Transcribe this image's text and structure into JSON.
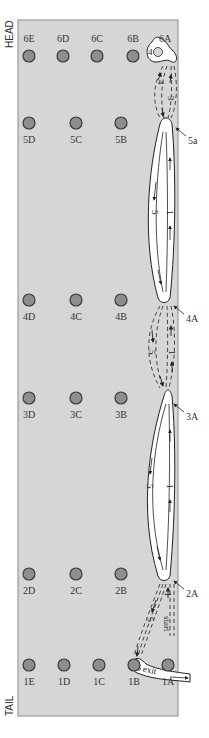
{
  "diagram": {
    "title": "",
    "side_labels": {
      "head": "HEAD",
      "tail": "TAIL"
    },
    "colors": {
      "panel_fill": "#d6d6d6",
      "panel_stroke": "#8a8a8a",
      "peg_fill": "#8e8e8e",
      "peg_stroke": "#3a3a3a",
      "loop_fill": "#ffffff",
      "loop_stroke": "#222222",
      "dash": "#333333"
    },
    "pegs": [
      {
        "id": "6E",
        "label": "6E",
        "x": 29,
        "y": 56
      },
      {
        "id": "6D",
        "label": "6D",
        "x": 63,
        "y": 56
      },
      {
        "id": "6C",
        "label": "6C",
        "x": 97,
        "y": 56
      },
      {
        "id": "6B",
        "label": "6B",
        "x": 133,
        "y": 56
      },
      {
        "id": "6A",
        "label": "6A",
        "x": 165,
        "y": 56
      },
      {
        "id": "5D",
        "label": "5D",
        "x": 29,
        "y": 123
      },
      {
        "id": "5C",
        "label": "5C",
        "x": 76,
        "y": 123
      },
      {
        "id": "5B",
        "label": "5B",
        "x": 121,
        "y": 123
      },
      {
        "id": "4D",
        "label": "4D",
        "x": 29,
        "y": 300
      },
      {
        "id": "4C",
        "label": "4C",
        "x": 76,
        "y": 300
      },
      {
        "id": "4B",
        "label": "4B",
        "x": 121,
        "y": 300
      },
      {
        "id": "3D",
        "label": "3D",
        "x": 29,
        "y": 398
      },
      {
        "id": "3C",
        "label": "3C",
        "x": 76,
        "y": 398
      },
      {
        "id": "3B",
        "label": "3B",
        "x": 121,
        "y": 398
      },
      {
        "id": "2D",
        "label": "2D",
        "x": 29,
        "y": 574
      },
      {
        "id": "2C",
        "label": "2C",
        "x": 76,
        "y": 574
      },
      {
        "id": "2B",
        "label": "2B",
        "x": 121,
        "y": 574
      },
      {
        "id": "1E",
        "label": "1E",
        "x": 29,
        "y": 665
      },
      {
        "id": "1D",
        "label": "1D",
        "x": 64,
        "y": 665
      },
      {
        "id": "1C",
        "label": "1C",
        "x": 99,
        "y": 665
      },
      {
        "id": "1B",
        "label": "1B",
        "x": 134,
        "y": 665
      },
      {
        "id": "1A",
        "label": "1A",
        "x": 168,
        "y": 665
      }
    ],
    "annotations": [
      {
        "id": "5a",
        "label": "5a",
        "x": 188,
        "y": 144
      },
      {
        "id": "4A",
        "label": "4A",
        "x": 186,
        "y": 322
      },
      {
        "id": "3A",
        "label": "3A",
        "x": 186,
        "y": 420
      },
      {
        "id": "2A",
        "label": "2A",
        "x": 186,
        "y": 597
      }
    ],
    "path_labels": {
      "start": "start",
      "exit": "6 exit",
      "num_1": "1",
      "num_3": "3",
      "num_4": "4",
      "num_5": "5"
    }
  }
}
